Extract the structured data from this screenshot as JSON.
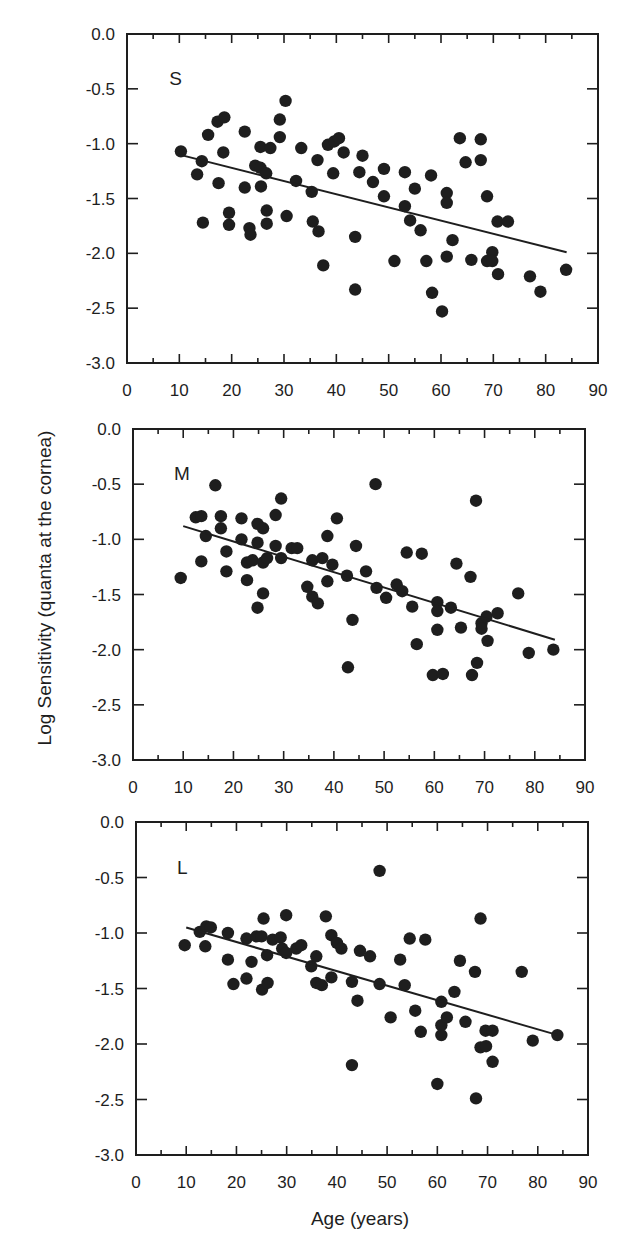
{
  "figure": {
    "y_axis_label": "Log Sensitivity  (quanta  at the cornea)",
    "x_axis_label": "Age  (years)",
    "colors": {
      "ink": "#1e1e1e",
      "background": "#ffffff"
    }
  },
  "chart_data": [
    {
      "type": "scatter",
      "panel_label": "S",
      "xlabel": "Age (years)",
      "ylabel": "Log Sensitivity (quanta at the cornea)",
      "xlim": [
        0,
        90
      ],
      "ylim": [
        -3.0,
        0.0
      ],
      "x_ticks": [
        0,
        10,
        20,
        30,
        40,
        50,
        60,
        70,
        80,
        90
      ],
      "y_ticks": [
        "0.0",
        "-0.5",
        "-1.0",
        "-1.5",
        "-2.0",
        "-2.5",
        "-3.0"
      ],
      "grid": false,
      "fit_line": {
        "x": [
          10,
          84
        ],
        "y": [
          -1.1,
          -1.99
        ]
      },
      "points": [
        [
          10.3,
          -1.07
        ],
        [
          13.4,
          -1.28
        ],
        [
          14.3,
          -1.16
        ],
        [
          14.5,
          -1.72
        ],
        [
          15.5,
          -0.92
        ],
        [
          17.3,
          -0.8
        ],
        [
          18.6,
          -0.76
        ],
        [
          18.4,
          -1.08
        ],
        [
          17.5,
          -1.36
        ],
        [
          19.5,
          -1.63
        ],
        [
          19.5,
          -1.74
        ],
        [
          22.5,
          -0.89
        ],
        [
          22.5,
          -1.4
        ],
        [
          23.4,
          -1.77
        ],
        [
          23.6,
          -1.83
        ],
        [
          24.5,
          -1.2
        ],
        [
          25.5,
          -1.03
        ],
        [
          25.5,
          -1.22
        ],
        [
          25.6,
          -1.39
        ],
        [
          26.6,
          -1.27
        ],
        [
          26.7,
          -1.61
        ],
        [
          26.7,
          -1.73
        ],
        [
          27.4,
          -1.04
        ],
        [
          29.2,
          -0.94
        ],
        [
          29.2,
          -0.78
        ],
        [
          30.3,
          -0.61
        ],
        [
          30.5,
          -1.66
        ],
        [
          32.3,
          -1.34
        ],
        [
          33.3,
          -1.04
        ],
        [
          35.3,
          -1.44
        ],
        [
          35.5,
          -1.71
        ],
        [
          36.4,
          -1.15
        ],
        [
          36.6,
          -1.8
        ],
        [
          37.5,
          -2.11
        ],
        [
          38.4,
          -1.01
        ],
        [
          39.6,
          -0.98
        ],
        [
          40.5,
          -0.95
        ],
        [
          39.4,
          -1.27
        ],
        [
          41.4,
          -1.08
        ],
        [
          43.6,
          -1.85
        ],
        [
          43.6,
          -2.33
        ],
        [
          44.4,
          -1.26
        ],
        [
          45.0,
          -1.11
        ],
        [
          47.0,
          -1.35
        ],
        [
          49.1,
          -1.23
        ],
        [
          49.1,
          -1.48
        ],
        [
          51.1,
          -2.07
        ],
        [
          53.1,
          -1.26
        ],
        [
          53.1,
          -1.57
        ],
        [
          54.1,
          -1.7
        ],
        [
          55.0,
          -1.41
        ],
        [
          56.1,
          -1.79
        ],
        [
          57.2,
          -2.07
        ],
        [
          58.1,
          -1.29
        ],
        [
          58.3,
          -2.36
        ],
        [
          60.2,
          -2.53
        ],
        [
          61.1,
          -1.45
        ],
        [
          61.1,
          -1.54
        ],
        [
          61.1,
          -2.03
        ],
        [
          62.2,
          -1.88
        ],
        [
          63.6,
          -0.95
        ],
        [
          64.7,
          -1.17
        ],
        [
          65.8,
          -2.06
        ],
        [
          67.6,
          -0.96
        ],
        [
          67.6,
          -1.15
        ],
        [
          68.8,
          -1.48
        ],
        [
          68.8,
          -2.07
        ],
        [
          69.8,
          -1.99
        ],
        [
          69.8,
          -2.07
        ],
        [
          70.8,
          -1.71
        ],
        [
          70.9,
          -2.19
        ],
        [
          72.8,
          -1.71
        ],
        [
          77.0,
          -2.21
        ],
        [
          79.0,
          -2.35
        ],
        [
          83.9,
          -2.15
        ]
      ],
      "layout": {
        "left": 127,
        "top": 34,
        "right": 598,
        "bottom": 363
      }
    },
    {
      "type": "scatter",
      "panel_label": "M",
      "xlabel": "Age (years)",
      "ylabel": "Log Sensitivity (quanta at the cornea)",
      "xlim": [
        0,
        90
      ],
      "ylim": [
        -3.0,
        0.0
      ],
      "x_ticks": [
        0,
        10,
        20,
        30,
        40,
        50,
        60,
        70,
        80,
        90
      ],
      "y_ticks": [
        "0.0",
        "-0.5",
        "-1.0",
        "-1.5",
        "-2.0",
        "-2.5",
        "-3.0"
      ],
      "grid": false,
      "fit_line": {
        "x": [
          10,
          84
        ],
        "y": [
          -0.88,
          -1.91
        ]
      },
      "points": [
        [
          9.5,
          -1.35
        ],
        [
          12.5,
          -0.8
        ],
        [
          13.6,
          -0.79
        ],
        [
          13.6,
          -1.2
        ],
        [
          14.5,
          -0.97
        ],
        [
          16.4,
          -0.51
        ],
        [
          17.5,
          -0.79
        ],
        [
          17.5,
          -0.9
        ],
        [
          18.6,
          -1.11
        ],
        [
          18.6,
          -1.29
        ],
        [
          21.6,
          -0.81
        ],
        [
          21.6,
          -1.0
        ],
        [
          22.7,
          -1.21
        ],
        [
          22.7,
          -1.37
        ],
        [
          23.8,
          -1.19
        ],
        [
          24.8,
          -0.86
        ],
        [
          24.8,
          -1.03
        ],
        [
          24.8,
          -1.62
        ],
        [
          25.9,
          -0.9
        ],
        [
          25.9,
          -1.21
        ],
        [
          25.9,
          -1.49
        ],
        [
          26.7,
          -1.17
        ],
        [
          28.4,
          -0.78
        ],
        [
          28.4,
          -1.06
        ],
        [
          29.5,
          -0.63
        ],
        [
          29.5,
          -1.17
        ],
        [
          31.6,
          -1.08
        ],
        [
          32.7,
          -1.08
        ],
        [
          34.7,
          -1.43
        ],
        [
          35.7,
          -1.19
        ],
        [
          35.7,
          -1.52
        ],
        [
          36.8,
          -1.58
        ],
        [
          37.7,
          -1.17
        ],
        [
          38.7,
          -0.97
        ],
        [
          38.7,
          -1.38
        ],
        [
          39.7,
          -1.23
        ],
        [
          40.6,
          -0.81
        ],
        [
          42.6,
          -1.33
        ],
        [
          42.8,
          -2.16
        ],
        [
          43.7,
          -1.73
        ],
        [
          44.4,
          -1.06
        ],
        [
          46.4,
          -1.29
        ],
        [
          48.3,
          -0.5
        ],
        [
          48.5,
          -1.44
        ],
        [
          50.4,
          -1.53
        ],
        [
          52.5,
          -1.41
        ],
        [
          53.6,
          -1.47
        ],
        [
          54.5,
          -1.12
        ],
        [
          55.6,
          -1.61
        ],
        [
          56.5,
          -1.95
        ],
        [
          57.5,
          -1.13
        ],
        [
          59.7,
          -2.23
        ],
        [
          60.6,
          -1.57
        ],
        [
          60.6,
          -1.65
        ],
        [
          60.6,
          -1.82
        ],
        [
          61.7,
          -2.22
        ],
        [
          63.3,
          -1.62
        ],
        [
          64.4,
          -1.22
        ],
        [
          65.3,
          -1.8
        ],
        [
          67.2,
          -1.34
        ],
        [
          67.5,
          -2.23
        ],
        [
          68.3,
          -0.65
        ],
        [
          68.5,
          -2.12
        ],
        [
          69.4,
          -1.76
        ],
        [
          69.4,
          -1.81
        ],
        [
          70.4,
          -1.7
        ],
        [
          70.6,
          -1.92
        ],
        [
          72.6,
          -1.67
        ],
        [
          76.7,
          -1.49
        ],
        [
          78.8,
          -2.03
        ],
        [
          83.7,
          -2.0
        ]
      ],
      "layout": {
        "left": 133,
        "top": 429,
        "right": 585,
        "bottom": 760
      }
    },
    {
      "type": "scatter",
      "panel_label": "L",
      "xlabel": "Age (years)",
      "ylabel": "Log Sensitivity (quanta at the cornea)",
      "xlim": [
        0,
        90
      ],
      "ylim": [
        -3.0,
        0.0
      ],
      "x_ticks": [
        0,
        10,
        20,
        30,
        40,
        50,
        60,
        70,
        80,
        90
      ],
      "y_ticks": [
        "0.0",
        "-0.5",
        "-1.0",
        "-1.5",
        "-2.0",
        "-2.5",
        "-3.0"
      ],
      "grid": false,
      "fit_line": {
        "x": [
          10,
          84
        ],
        "y": [
          -0.95,
          -1.92
        ]
      },
      "points": [
        [
          9.7,
          -1.11
        ],
        [
          12.7,
          -0.99
        ],
        [
          14.0,
          -0.94
        ],
        [
          14.9,
          -0.95
        ],
        [
          13.8,
          -1.12
        ],
        [
          18.3,
          -1.0
        ],
        [
          18.3,
          -1.24
        ],
        [
          19.4,
          -1.46
        ],
        [
          22.0,
          -1.05
        ],
        [
          22.0,
          -1.41
        ],
        [
          23.0,
          -1.26
        ],
        [
          24.0,
          -1.03
        ],
        [
          25.4,
          -0.87
        ],
        [
          25.0,
          -1.03
        ],
        [
          25.1,
          -1.51
        ],
        [
          26.1,
          -1.2
        ],
        [
          26.2,
          -1.45
        ],
        [
          27.2,
          -1.06
        ],
        [
          28.8,
          -1.04
        ],
        [
          29.9,
          -0.84
        ],
        [
          29.1,
          -1.14
        ],
        [
          29.9,
          -1.18
        ],
        [
          31.9,
          -1.14
        ],
        [
          32.9,
          -1.11
        ],
        [
          34.9,
          -1.3
        ],
        [
          35.9,
          -1.21
        ],
        [
          35.9,
          -1.45
        ],
        [
          37.0,
          -1.47
        ],
        [
          37.8,
          -0.85
        ],
        [
          38.9,
          -1.02
        ],
        [
          38.9,
          -1.4
        ],
        [
          40.0,
          -1.09
        ],
        [
          40.9,
          -1.14
        ],
        [
          43.0,
          -1.44
        ],
        [
          43.0,
          -2.19
        ],
        [
          44.1,
          -1.61
        ],
        [
          44.6,
          -1.16
        ],
        [
          46.6,
          -1.21
        ],
        [
          48.5,
          -0.44
        ],
        [
          48.5,
          -1.46
        ],
        [
          50.7,
          -1.76
        ],
        [
          52.6,
          -1.24
        ],
        [
          53.5,
          -1.47
        ],
        [
          54.5,
          -1.05
        ],
        [
          55.6,
          -1.7
        ],
        [
          56.7,
          -1.89
        ],
        [
          57.6,
          -1.06
        ],
        [
          60.0,
          -2.36
        ],
        [
          60.8,
          -1.62
        ],
        [
          60.8,
          -1.83
        ],
        [
          60.8,
          -1.92
        ],
        [
          61.9,
          -1.76
        ],
        [
          63.4,
          -1.53
        ],
        [
          64.5,
          -1.25
        ],
        [
          65.6,
          -1.8
        ],
        [
          67.5,
          -1.35
        ],
        [
          67.7,
          -2.49
        ],
        [
          68.6,
          -0.87
        ],
        [
          68.6,
          -2.03
        ],
        [
          69.7,
          -2.02
        ],
        [
          69.6,
          -1.88
        ],
        [
          71.0,
          -1.88
        ],
        [
          71.0,
          -2.16
        ],
        [
          76.8,
          -1.35
        ],
        [
          79.0,
          -1.97
        ],
        [
          83.9,
          -1.92
        ]
      ],
      "layout": {
        "left": 136,
        "top": 822,
        "right": 588,
        "bottom": 1155
      }
    }
  ]
}
